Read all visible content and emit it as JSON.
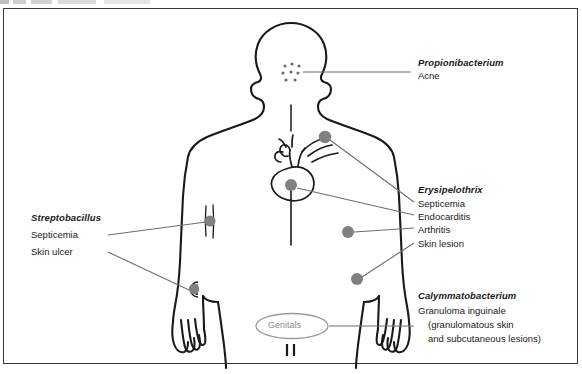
{
  "diagram": {
    "type": "anatomical-body-map",
    "frame_color": "#3a3a3a",
    "marker_color": "#808080",
    "body_outline_color": "#1a1a1a",
    "leader_line_color": "#6e6e6e"
  },
  "body": {
    "genitals_label": "Genitals",
    "genitals_label_color": "#8d8d8d",
    "acne_dot_count": 8,
    "marker_sites": [
      {
        "name": "face-acne-cluster",
        "region": "cheek"
      },
      {
        "name": "heart-aorta-marker",
        "region": "great vessels"
      },
      {
        "name": "heart-ventricle-marker",
        "region": "heart"
      },
      {
        "name": "left-arm-upper-marker",
        "region": "left forearm vein"
      },
      {
        "name": "left-arm-ulcer-marker",
        "region": "left wrist"
      },
      {
        "name": "right-arm-upper-marker",
        "region": "right elbow"
      },
      {
        "name": "right-arm-lower-marker",
        "region": "right forearm"
      }
    ]
  },
  "labels": {
    "propionibacterium": {
      "genus": "Propionibacterium",
      "diseases": [
        "Acne"
      ]
    },
    "erysipelothrix": {
      "genus": "Erysipelothrix",
      "diseases": [
        "Septicemia",
        "Endocarditis",
        "Arthritis",
        "Skin lesion"
      ]
    },
    "streptobacillus": {
      "genus": "Streptobacillus",
      "diseases": [
        "Septicemia",
        "Skin ulcer"
      ]
    },
    "calymmatobacterium": {
      "genus": "Calymmatobacterium",
      "diseases": [
        "Granuloma inguinale"
      ],
      "detail_line1": "(granulomatous skin",
      "detail_line2": "and subcutaneous lesions)"
    }
  }
}
